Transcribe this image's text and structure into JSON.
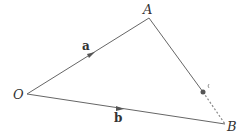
{
  "diagram": {
    "type": "vector-triangle",
    "points": {
      "O": {
        "label": "O",
        "x": 27,
        "y": 94
      },
      "A": {
        "label": "A",
        "x": 149,
        "y": 18
      },
      "B": {
        "label": "B",
        "x": 225,
        "y": 124
      },
      "P": {
        "label": "",
        "x": 203,
        "y": 92
      }
    },
    "vectors": [
      {
        "name": "a",
        "label": "a",
        "from": "O",
        "to": "A"
      },
      {
        "name": "b",
        "label": "b",
        "from": "O",
        "to": "B"
      }
    ],
    "segments": [
      {
        "from": "A",
        "to": "B",
        "style": "solid-then-dashed"
      }
    ],
    "colors": {
      "line": "#666666",
      "point": "#555555",
      "text": "#333333"
    }
  }
}
